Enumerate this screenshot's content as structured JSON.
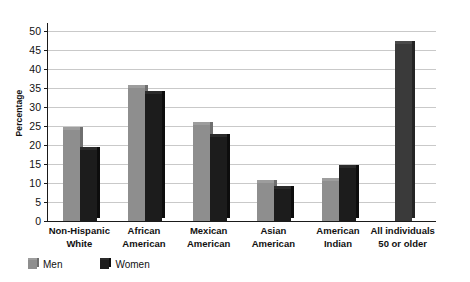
{
  "chart_data": {
    "type": "bar",
    "title": "",
    "subtitle": "",
    "xlabel": "",
    "ylabel": "Percentage",
    "ylim": [
      0,
      52
    ],
    "yticks": [
      0,
      5,
      10,
      15,
      20,
      25,
      30,
      35,
      40,
      45,
      50
    ],
    "ytick_labels": [
      "0",
      "5",
      "10",
      "15",
      "20",
      "25",
      "30",
      "35",
      "40",
      "45",
      "50"
    ],
    "grid": true,
    "legend_position": "bottom-left",
    "categories": [
      "Non-Hispanic White",
      "African American",
      "Mexican American",
      "Asian American",
      "American Indian",
      "All individuals 50 or older"
    ],
    "category_lines": [
      [
        "Non-Hispanic",
        "White"
      ],
      [
        "African",
        "American"
      ],
      [
        "Mexican",
        "American"
      ],
      [
        "Asian",
        "American"
      ],
      [
        "American",
        "Indian"
      ],
      [
        "All individuals",
        "50 or older"
      ]
    ],
    "series": [
      {
        "name": "Men",
        "color": "#8e8e8e",
        "values": [
          24.0,
          35.0,
          25.3,
          10.0,
          10.6,
          null
        ]
      },
      {
        "name": "Women",
        "color": "#1c1c1c",
        "values": [
          18.7,
          33.4,
          22.0,
          8.5,
          14.0,
          46.5
        ]
      }
    ]
  },
  "legend": {
    "items": [
      {
        "label": "Men",
        "swatch": "men-swatch"
      },
      {
        "label": "Women",
        "swatch": "women-swatch"
      }
    ]
  },
  "axis": {
    "y_title": "Percentage"
  }
}
